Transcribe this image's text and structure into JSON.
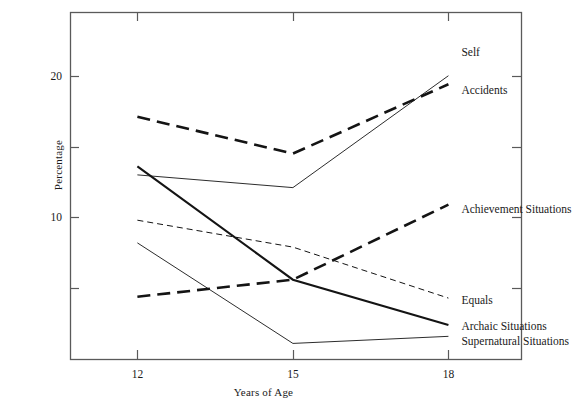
{
  "chart_data": {
    "type": "line",
    "title": "",
    "xlabel": "Years of Age",
    "ylabel": "Percentage",
    "x": [
      12,
      15,
      18
    ],
    "xlim": [
      10.7,
      19.4
    ],
    "ylim": [
      0.0,
      24.5
    ],
    "xticks": [
      12,
      15,
      18
    ],
    "xticklabels": [
      "12",
      "15",
      "18"
    ],
    "yticks": [
      5,
      10,
      15,
      20
    ],
    "yticklabels": [
      "",
      "10",
      "",
      "20"
    ],
    "grid": false,
    "legend_position": "right-inline-labels",
    "series": [
      {
        "name": "Self",
        "values": [
          13.0,
          12.1,
          20.0
        ],
        "style": "thin-solid",
        "label_x": 18.25,
        "label_y": 21.7
      },
      {
        "name": "Accidents",
        "values": [
          17.1,
          14.5,
          19.4
        ],
        "style": "thick-dashed",
        "label_x": 18.25,
        "label_y": 19.0
      },
      {
        "name": "Achievement Situations",
        "values": [
          4.4,
          5.6,
          10.9
        ],
        "style": "thick-dashed",
        "label_x": 18.25,
        "label_y": 10.6
      },
      {
        "name": "Equals",
        "values": [
          9.8,
          7.9,
          4.3
        ],
        "style": "thin-dashed",
        "label_x": 18.25,
        "label_y": 4.2
      },
      {
        "name": "Archaic Situations",
        "values": [
          13.6,
          5.6,
          2.4
        ],
        "style": "thick-solid",
        "label_x": 18.25,
        "label_y": 2.3
      },
      {
        "name": "Supernatural Situations",
        "values": [
          8.2,
          1.1,
          1.6
        ],
        "style": "thin-solid",
        "label_x": 18.25,
        "label_y": 1.3
      }
    ]
  },
  "axis": {
    "frame_color": "#5a5a5a",
    "line_color": "#141414"
  }
}
